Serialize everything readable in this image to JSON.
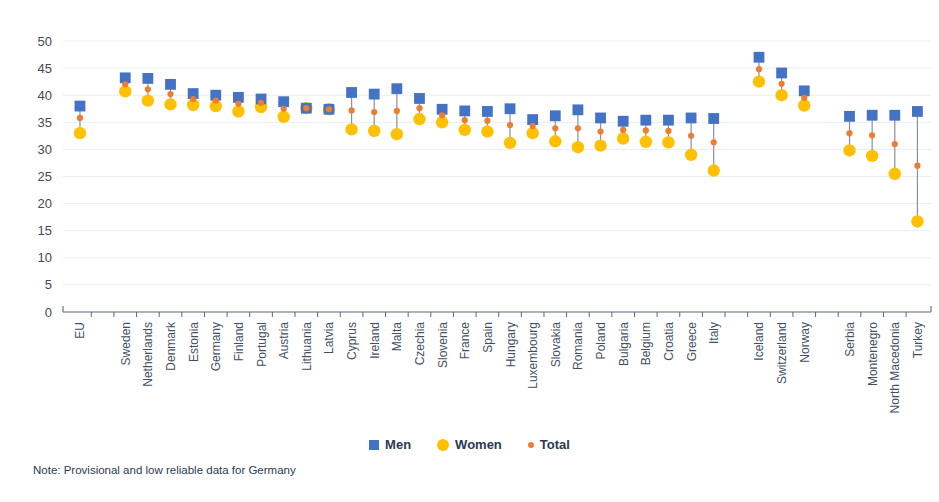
{
  "chart_data": {
    "type": "scatter",
    "title": "",
    "xlabel": "",
    "ylabel": "",
    "ylim": [
      0,
      50
    ],
    "ytick_step": 5,
    "yticks": [
      0,
      5,
      10,
      15,
      20,
      25,
      30,
      35,
      40,
      45,
      50
    ],
    "grid": true,
    "legend_position": "bottom",
    "categories": [
      "EU",
      "Sweden",
      "Netherlands",
      "Denmark",
      "Estonia",
      "Germany",
      "Finland",
      "Portugal",
      "Austria",
      "Lithuania",
      "Latvia",
      "Cyprus",
      "Ireland",
      "Malta",
      "Czechia",
      "Slovenia",
      "France",
      "Spain",
      "Hungary",
      "Luxembourg",
      "Slovakia",
      "Romania",
      "Poland",
      "Bulgaria",
      "Belgium",
      "Croatia",
      "Greece",
      "Italy",
      "Iceland",
      "Switzerland",
      "Norway",
      "Serbia",
      "Montenegro",
      "North Macedonia",
      "Turkey"
    ],
    "group_breaks_after": [
      "EU",
      "Italy",
      "Norway"
    ],
    "series": [
      {
        "name": "Men",
        "color": "#4472c4",
        "marker": "square",
        "values": [
          38.0,
          43.2,
          43.1,
          42.0,
          40.3,
          40.0,
          39.6,
          39.3,
          38.8,
          37.6,
          37.4,
          40.5,
          40.2,
          41.2,
          39.4,
          37.4,
          37.1,
          37.0,
          37.5,
          35.5,
          36.2,
          37.3,
          35.8,
          35.2,
          35.4,
          35.4,
          35.8,
          35.7,
          47.0,
          44.1,
          40.8,
          36.1,
          36.3,
          36.3,
          37.0
        ]
      },
      {
        "name": "Women",
        "color": "#ffc000",
        "marker": "circle",
        "values": [
          33.0,
          40.7,
          39.0,
          38.3,
          38.2,
          38.0,
          37.0,
          37.8,
          36.0,
          37.6,
          37.4,
          33.7,
          33.4,
          32.8,
          35.6,
          35.0,
          33.6,
          33.3,
          31.2,
          33.0,
          31.5,
          30.4,
          30.7,
          32.0,
          31.4,
          31.3,
          29.0,
          26.1,
          42.5,
          40.0,
          38.1,
          29.8,
          28.8,
          25.5,
          16.7
        ]
      },
      {
        "name": "Total",
        "color": "#ed7d31",
        "marker": "dot",
        "values": [
          35.8,
          42.0,
          41.1,
          40.2,
          39.3,
          39.0,
          38.4,
          38.6,
          37.5,
          37.6,
          37.4,
          37.2,
          36.9,
          37.1,
          37.6,
          36.3,
          35.4,
          35.3,
          34.5,
          34.3,
          33.9,
          33.9,
          33.3,
          33.6,
          33.5,
          33.4,
          32.5,
          31.3,
          44.8,
          42.1,
          39.5,
          33.0,
          32.6,
          31.0,
          27.0
        ]
      }
    ]
  },
  "legend": {
    "items": [
      {
        "label": "Men"
      },
      {
        "label": "Women"
      },
      {
        "label": "Total"
      }
    ]
  },
  "note": {
    "text": "Note: Provisional and low reliable data for Germany"
  }
}
